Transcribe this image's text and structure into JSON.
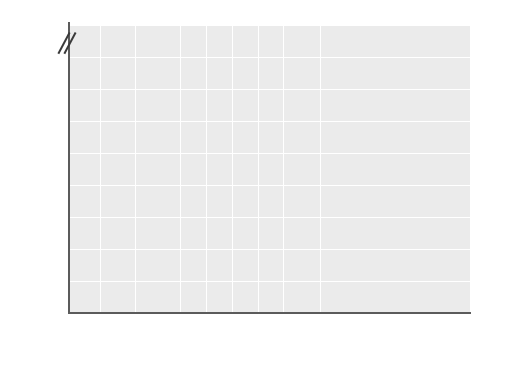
{
  "chart_data": {
    "type": "area",
    "title": "",
    "xlabel": "",
    "ylabel": "Average daily sleep (hours)",
    "ylim": [
      0,
      24
    ],
    "y_break": {
      "from": 16,
      "to": 24,
      "note": "axis break between 16 and 24"
    },
    "yticks": [
      0,
      2,
      4,
      6,
      8,
      10,
      12,
      14,
      16,
      24
    ],
    "grid": true,
    "legend_position": "inline-annotations",
    "categories": [
      "1-15 days",
      "3-5 mos.",
      "6-23 mos.",
      "2-3 yrs.",
      "3-5 yrs.",
      "5-13 yrs.",
      "14-18 yrs.",
      "19-30 yrs.",
      "33-45 yrs.",
      "90 yrs."
    ],
    "xtick_labels": [
      {
        "line1": "1–15",
        "line2": "days"
      },
      {
        "line1": "3–5",
        "line2": "mos."
      },
      {
        "line1": "6–23",
        "line2": "mos."
      },
      {
        "line1": "2–3",
        "line2": "yrs."
      },
      {
        "line1": "3–5",
        "line2": "yrs."
      },
      {
        "line1": "5–13",
        "line2": "yrs."
      },
      {
        "line1": "14–18",
        "line2": "yrs."
      },
      {
        "line1": "19–30",
        "line2": "yrs."
      },
      {
        "line1": "33–45",
        "line2": "yrs."
      },
      {
        "line1": "90",
        "line2": "yrs."
      }
    ],
    "series": [
      {
        "name": "Total sleep (top of REM band)",
        "values": [
          16.0,
          14.0,
          13.0,
          12.0,
          11.0,
          10.0,
          8.5,
          8.0,
          7.5,
          5.8
        ]
      },
      {
        "name": "Slow-wave sleep boundary (bottom of REM band)",
        "values": [
          8.0,
          8.5,
          9.0,
          8.5,
          8.0,
          7.0,
          6.3,
          6.0,
          5.8,
          4.0
        ]
      }
    ],
    "annotations": [
      {
        "text": "Waking",
        "x": 260,
        "y": 103
      },
      {
        "text": "REM sleep",
        "x": 122,
        "y": 134
      },
      {
        "text": "Slow-wave sleep",
        "x": 268,
        "y": 258
      }
    ],
    "age_groups": [
      {
        "label": "Infancy",
        "start": 69,
        "end": 152
      },
      {
        "label": "Childhood",
        "start": 157,
        "end": 245
      },
      {
        "label": "Adolescence",
        "start": 250,
        "end": 296
      },
      {
        "label": "Adulthood and old age",
        "start": 301,
        "end": 470
      }
    ],
    "colors": {
      "plot_background": "#ebebeb",
      "waking_band": "#e2e2e2",
      "rem_band": "#d2d2d2",
      "slow_wave_band": "#e0e0e0",
      "gridline": "#ffffff",
      "axis": "#5b5b5b",
      "text": "#1a1a1a"
    }
  }
}
